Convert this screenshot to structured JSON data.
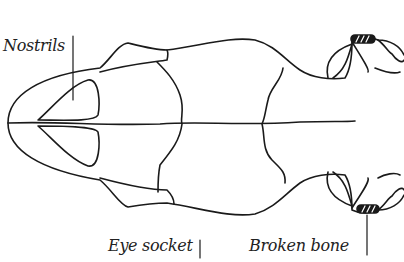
{
  "diagram": {
    "labels": {
      "nostrils": "Nostrils",
      "eye_socket": "Eye socket",
      "broken_bone": "Broken bone"
    },
    "colors": {
      "line": "#1a1a1a",
      "background": "#ffffff"
    }
  }
}
